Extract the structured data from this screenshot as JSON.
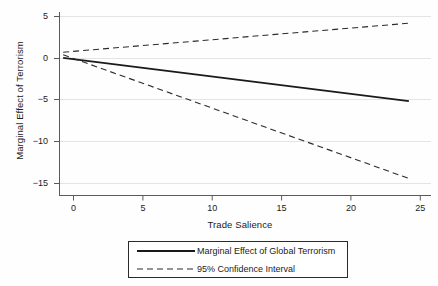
{
  "chart_data": {
    "type": "line",
    "title": "",
    "xlabel": "Trade Salience",
    "ylabel": "Marginal Effect of Terrorism",
    "xlim": [
      -1.3,
      25.6
    ],
    "ylim": [
      -16.0,
      5.6
    ],
    "xticks": [
      0,
      5,
      10,
      15,
      20,
      25
    ],
    "yticks": [
      5,
      0,
      -5,
      -10,
      -15
    ],
    "xtick_labels": [
      "0",
      "5",
      "10",
      "15",
      "20",
      "25"
    ],
    "ytick_labels": [
      "5",
      "0",
      "−5",
      "−10",
      "−15"
    ],
    "grid": "horizontal",
    "legend_position": "below-axes",
    "series": [
      {
        "name": "Marginal Effect of Global Terrorism",
        "style": "solid",
        "color": "#1a1a1a",
        "x": [
          -1.0,
          24.0
        ],
        "y": [
          0.18,
          -4.92
        ]
      },
      {
        "name": "95% Confidence Interval Upper",
        "style": "dashed",
        "color": "#2b2b2b",
        "x": [
          -1.0,
          24.0
        ],
        "y": [
          0.85,
          4.28
        ]
      },
      {
        "name": "95% Confidence Interval Lower",
        "style": "dashed",
        "color": "#2b2b2b",
        "x": [
          -1.0,
          24.0
        ],
        "y": [
          0.55,
          -14.05
        ]
      }
    ]
  },
  "legend": {
    "entries": [
      {
        "label": "Marginal Effect of Global Terrorism",
        "style": "solid"
      },
      {
        "label": "95% Confidence Interval",
        "style": "dashed"
      }
    ]
  },
  "colors": {
    "line": "#1a1a1a",
    "ci": "#2b2b2b",
    "grid": "#e4e4e4",
    "axis": "#5a5a5a",
    "background": "#fefefe"
  }
}
